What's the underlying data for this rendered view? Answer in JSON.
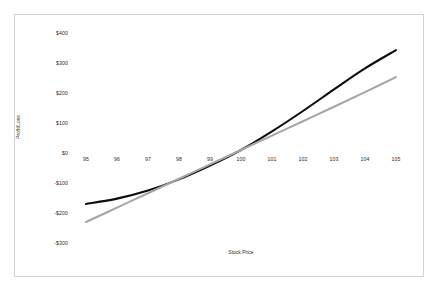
{
  "chart_data": {
    "type": "line",
    "title": "",
    "xlabel": "Stock Price",
    "ylabel": "Profit/Loss",
    "x": [
      95,
      96,
      97,
      98,
      99,
      100,
      101,
      102,
      103,
      104,
      105
    ],
    "xlim": [
      95,
      105
    ],
    "ylim": [
      -300,
      400
    ],
    "grid": false,
    "legend": "none",
    "x_tick_labels": [
      "95",
      "96",
      "97",
      "98",
      "99",
      "100",
      "101",
      "102",
      "103",
      "104",
      "105"
    ],
    "y_tick_labels": [
      "$400",
      "$300",
      "$200",
      "$100",
      "$0",
      "-$100",
      "-$200",
      "-$300"
    ],
    "y_ticks": [
      400,
      300,
      200,
      100,
      0,
      -100,
      -200,
      -300
    ],
    "series": [
      {
        "name": "Option Position",
        "color": "#0d0d0d",
        "width": 2.1,
        "values": [
          -170,
          -152,
          -125,
          -88,
          -42,
          10,
          72,
          140,
          212,
          282,
          343
        ]
      },
      {
        "name": "Stock Position",
        "color": "#a6a6a6",
        "width": 2.1,
        "values": [
          -230,
          -182,
          -134,
          -86,
          -38,
          10,
          58,
          106,
          154,
          203,
          253
        ]
      }
    ]
  },
  "frame": {
    "border_color": "#d4d4d4",
    "background": "#ffffff"
  }
}
